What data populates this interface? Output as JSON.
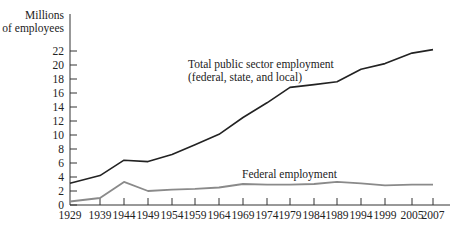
{
  "chart_data": {
    "type": "line",
    "title": "",
    "ylabel": "Millions of employees",
    "ylabel_lines": [
      "Millions",
      "of employees"
    ],
    "xlabel": "",
    "ylim": [
      0,
      22
    ],
    "yticks": [
      0,
      2,
      4,
      6,
      8,
      10,
      12,
      14,
      16,
      18,
      20,
      22
    ],
    "x": [
      1929,
      1939,
      1944,
      1949,
      1954,
      1959,
      1964,
      1969,
      1974,
      1979,
      1984,
      1989,
      1994,
      1999,
      2005,
      2007
    ],
    "xtick_labels": [
      "1929",
      "1939",
      "1944",
      "1949",
      "1954",
      "1959",
      "1964",
      "1969",
      "1974",
      "1979",
      "1984",
      "1989",
      "1994",
      "1999",
      "2005",
      "2007"
    ],
    "grid": false,
    "legend": "none (inline annotations)",
    "series": [
      {
        "name": "Total public sector employment (federal, state, and local)",
        "label_lines": [
          "Total public sector employment",
          "(federal, state, and local)"
        ],
        "color": "#222222",
        "values": [
          3.1,
          4.2,
          6.4,
          6.2,
          7.2,
          8.6,
          10.1,
          12.5,
          14.6,
          16.8,
          17.2,
          17.6,
          19.4,
          20.2,
          21.7,
          22.2
        ]
      },
      {
        "name": "Federal employment",
        "label_lines": [
          "Federal employment"
        ],
        "color": "#8a8a8a",
        "values": [
          0.5,
          1.0,
          3.3,
          2.0,
          2.2,
          2.3,
          2.5,
          3.0,
          2.9,
          2.9,
          3.0,
          3.3,
          3.1,
          2.8,
          2.9,
          2.9
        ]
      }
    ]
  }
}
